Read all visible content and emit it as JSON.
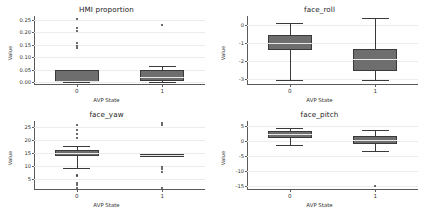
{
  "figure": {
    "width": 426,
    "height": 210,
    "background": "#ffffff",
    "box_fill": "#6e6e6e",
    "box_edge": "#3a3a3a",
    "grid_color": "#ececec",
    "layout": "2x2 grid of boxplots"
  },
  "chart_data": [
    {
      "type": "box",
      "title": "HMI proportion",
      "xlabel": "AVP State",
      "ylabel": "Value",
      "categories": [
        "0",
        "1"
      ],
      "ylim": [
        -0.012,
        0.265
      ],
      "yticks": [
        0.0,
        0.05,
        0.1,
        0.15,
        0.2,
        0.25
      ],
      "ytick_labels": [
        "0.00",
        "0.05",
        "0.10",
        "0.15",
        "0.20",
        "0.25"
      ],
      "grid": true,
      "legend": "none",
      "boxes": [
        {
          "category": "0",
          "whisker_low": 0.0,
          "q1": 0.002,
          "median": 0.003,
          "q3": 0.049,
          "whisker_high": 0.049,
          "outliers": [
            0.138,
            0.145,
            0.156,
            0.206,
            0.215,
            0.251
          ]
        },
        {
          "category": "1",
          "whisker_low": 0.0,
          "q1": 0.003,
          "median": 0.022,
          "q3": 0.047,
          "whisker_high": 0.064,
          "outliers": [
            0.228
          ]
        }
      ]
    },
    {
      "type": "box",
      "title": "face_roll",
      "xlabel": "AVP State",
      "ylabel": "Value",
      "categories": [
        "0",
        "1"
      ],
      "ylim": [
        -3.35,
        0.52
      ],
      "yticks": [
        0,
        -1,
        -2,
        -3
      ],
      "ytick_labels": [
        "0",
        "-1",
        "-2",
        "-3"
      ],
      "grid": true,
      "legend": "none",
      "boxes": [
        {
          "category": "0",
          "whisker_low": -3.08,
          "q1": -1.38,
          "median": -1.02,
          "q3": -0.55,
          "whisker_high": 0.12,
          "outliers": []
        },
        {
          "category": "1",
          "whisker_low": -3.07,
          "q1": -2.55,
          "median": -1.9,
          "q3": -1.32,
          "whisker_high": 0.4,
          "outliers": []
        }
      ]
    },
    {
      "type": "box",
      "title": "face_yaw",
      "xlabel": "AVP State",
      "ylabel": "Value",
      "categories": [
        "0",
        "1"
      ],
      "ylim": [
        0.6,
        27.5
      ],
      "yticks": [
        5,
        10,
        15,
        20,
        25
      ],
      "ytick_labels": [
        "5",
        "10",
        "15",
        "20",
        "25"
      ],
      "grid": true,
      "legend": "none",
      "boxes": [
        {
          "category": "0",
          "whisker_low": 9.2,
          "q1": 13.7,
          "median": 14.9,
          "q3": 16.2,
          "whisker_high": 17.9,
          "outliers": [
            1.5,
            2.4,
            3.3,
            5.9,
            6.6,
            20.8,
            22.4,
            24.1,
            25.8
          ]
        },
        {
          "category": "1",
          "whisker_low": 14.2,
          "q1": 14.2,
          "median": 14.4,
          "q3": 14.6,
          "whisker_high": 14.6,
          "outliers": [
            1.4,
            7.7,
            8.8,
            9.6,
            25.9,
            26.6
          ]
        }
      ]
    },
    {
      "type": "box",
      "title": "face_pitch",
      "xlabel": "AVP State",
      "ylabel": "Value",
      "categories": [
        "0",
        "1"
      ],
      "ylim": [
        -16.5,
        6.6
      ],
      "yticks": [
        5,
        0,
        -5,
        -10,
        -15
      ],
      "ytick_labels": [
        "5",
        "0",
        "-5",
        "-10",
        "-15"
      ],
      "grid": true,
      "legend": "none",
      "boxes": [
        {
          "category": "0",
          "whisker_low": -1.6,
          "q1": 0.9,
          "median": 2.3,
          "q3": 3.4,
          "whisker_high": 4.4,
          "outliers": []
        },
        {
          "category": "1",
          "whisker_low": -3.6,
          "q1": -1.1,
          "median": 0.2,
          "q3": 1.5,
          "whisker_high": 3.6,
          "outliers": [
            -15.1
          ]
        }
      ]
    }
  ]
}
